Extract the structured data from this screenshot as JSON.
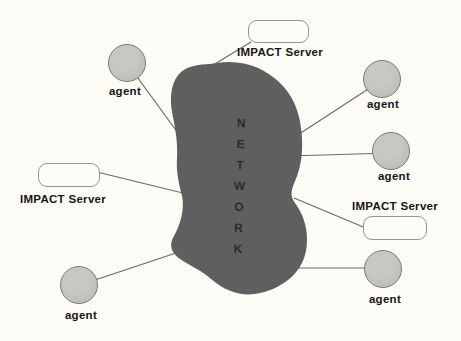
{
  "figure": {
    "network": {
      "label": "NETWORK",
      "fill": "#5f5f5f",
      "text_color": "#2c2c2c"
    },
    "servers": [
      {
        "id": "top",
        "label": "IMPACT Server"
      },
      {
        "id": "left",
        "label": "IMPACT Server"
      },
      {
        "id": "right",
        "label": "IMPACT Server"
      }
    ],
    "agents": [
      {
        "id": "top-left",
        "label": "agent"
      },
      {
        "id": "top-right",
        "label": "agent"
      },
      {
        "id": "mid-right",
        "label": "agent"
      },
      {
        "id": "bottom-right",
        "label": "agent"
      },
      {
        "id": "bottom-left",
        "label": "agent"
      }
    ],
    "colors": {
      "background": "#fcfbf6",
      "agent_fill": "#c0c0ba",
      "agent_border": "#7e7e79",
      "server_fill": "#fdfdf8",
      "server_border": "#96968f",
      "connection_line": "#6b6b66",
      "label_text": "#161616"
    }
  }
}
